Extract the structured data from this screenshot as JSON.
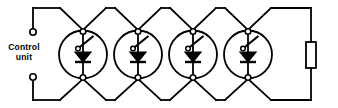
{
  "diagram": {
    "type": "electrical-schematic",
    "colors": {
      "stroke": "#000000",
      "background": "#ffffff",
      "fill": "#000000"
    },
    "canvas": {
      "width": 338,
      "height": 108
    },
    "line_width": 1.8
  },
  "control_unit": {
    "label_line1": "Control",
    "label_line2": "unit",
    "label_x": 24,
    "label_y": 54,
    "terminals": [
      {
        "name": "top-terminal",
        "cx": 33,
        "cy": 32,
        "r": 3.2
      },
      {
        "name": "bottom-terminal",
        "cx": 33,
        "cy": 77,
        "r": 3.2
      }
    ]
  },
  "bus": {
    "top_y": 8,
    "bottom_y": 100,
    "left_x": 33,
    "right_x": 311,
    "top_peak_half_width": 23,
    "node_top_y": 32,
    "node_bottom_y": 77
  },
  "thyristors": {
    "count": 4,
    "radius": 24,
    "centers_x": [
      83,
      138,
      193,
      248
    ],
    "center_y": 54.5,
    "terminal_dot_r": 2.6,
    "gate_dot_r": 2.2,
    "anode_y": 32,
    "cathode_y": 77,
    "symbol": {
      "triangle_half_width": 8,
      "triangle_top_y": 52,
      "triangle_bottom_y": 62,
      "bar_y": 62,
      "bar_half_width": 8,
      "gate_line_from": [
        78,
        48
      ],
      "gate_line_to": [
        93,
        37
      ]
    },
    "labels": [
      "thyristor-1",
      "thyristor-2",
      "thyristor-3",
      "thyristor-4"
    ]
  },
  "load_resistor": {
    "name": "load-resistor",
    "x": 306,
    "y": 42,
    "width": 10,
    "height": 26
  }
}
